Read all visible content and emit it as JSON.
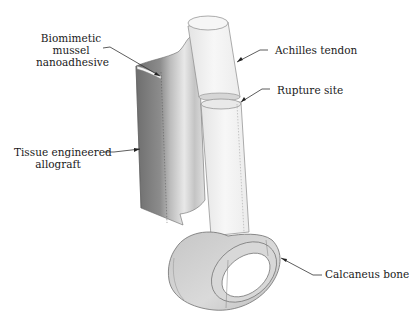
{
  "figure": {
    "type": "anatomical-schematic",
    "background": "#ffffff",
    "colors": {
      "tendon_fill": "#f1f1f1",
      "tendon_stroke": "#8a8a8a",
      "allograft_dark": "#7a7a7a",
      "allograft_light": "#d9d9d9",
      "bone_fill": "#cfcfcf",
      "leader_line": "#333333",
      "text": "#1a1a1a"
    }
  },
  "labels": {
    "nanoadhesive": {
      "line1": "Biomimetic",
      "line2": "mussel",
      "line3": "nanoadhesive"
    },
    "allograft": {
      "line1": "Tissue engineered",
      "line2": "allograft"
    },
    "achilles": {
      "text": "Achilles tendon"
    },
    "rupture": {
      "text": "Rupture site"
    },
    "calcaneus": {
      "text": "Calcaneus bone"
    }
  }
}
